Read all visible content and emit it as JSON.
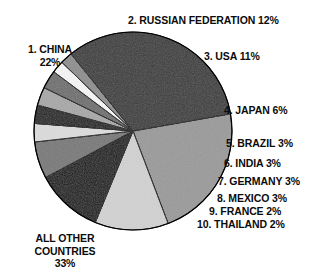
{
  "chart_data": {
    "type": "pie",
    "title": "",
    "categories": [
      "1. CHINA",
      "2. RUSSIAN FEDERATION",
      "3. USA",
      "4. JAPAN",
      "5. BRAZIL",
      "6. INDIA",
      "7. GERMANY",
      "8. MEXICO",
      "9. FRANCE",
      "10. THAILAND",
      "ALL OTHER COUNTRIES"
    ],
    "values": [
      22,
      12,
      11,
      6,
      3,
      3,
      3,
      3,
      2,
      2,
      33
    ],
    "unit": "%",
    "legend": "none",
    "grid": false,
    "slices": [
      {
        "rank": "1.",
        "name": "CHINA",
        "value": 22,
        "label": "1. CHINA\n22%",
        "color": "#9a9a9a"
      },
      {
        "rank": "2.",
        "name": "RUSSIAN FEDERATION",
        "value": 12,
        "label": "2. RUSSIAN FEDERATION 12%",
        "color": "#d2d2d2"
      },
      {
        "rank": "3.",
        "name": "USA",
        "value": 11,
        "label": "3. USA 11%",
        "color": "#111111"
      },
      {
        "rank": "4.",
        "name": "JAPAN",
        "value": 6,
        "label": "4. JAPAN 6%",
        "color": "#787878"
      },
      {
        "rank": "5.",
        "name": "BRAZIL",
        "value": 3,
        "label": "5. BRAZIL 3%",
        "color": "#dcdcdc"
      },
      {
        "rank": "6.",
        "name": "INDIA",
        "value": 3,
        "label": "6. INDIA 3%",
        "color": "#1a1a1a"
      },
      {
        "rank": "7.",
        "name": "GERMANY",
        "value": 3,
        "label": "7. GERMANY 3%",
        "color": "#a8a8a8"
      },
      {
        "rank": "8.",
        "name": "MEXICO",
        "value": 3,
        "label": "8. MEXICO 3%",
        "color": "#6f6f6f"
      },
      {
        "rank": "9.",
        "name": "FRANCE",
        "value": 2,
        "label": "9. FRANCE 2%",
        "color": "#f6f6f6"
      },
      {
        "rank": "10.",
        "name": "THAILAND",
        "value": 2,
        "label": "10. THAILAND 2%",
        "color": "#8e8e8e"
      },
      {
        "rank": "",
        "name": "ALL OTHER COUNTRIES",
        "value": 33,
        "label": "ALL OTHER\nCOUNTRIES\n33%",
        "color": "#3a3a3a"
      }
    ],
    "geometry": {
      "cx": 133,
      "cy": 131,
      "r": 99,
      "start_angle_deg": -10
    }
  },
  "labels": {
    "china": "1. CHINA\n22%",
    "russia": "2. RUSSIAN FEDERATION 12%",
    "usa": "3. USA 11%",
    "japan": "4. JAPAN 6%",
    "brazil": "5. BRAZIL 3%",
    "india": "6. INDIA 3%",
    "germany": "7. GERMANY 3%",
    "mexico": "8. MEXICO 3%",
    "france": "9. FRANCE 2%",
    "thailand": "10. THAILAND 2%",
    "other": "ALL OTHER\nCOUNTRIES\n33%"
  }
}
